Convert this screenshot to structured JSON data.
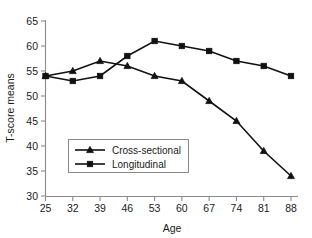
{
  "chart_data": {
    "type": "line",
    "title": "",
    "xlabel": "Age",
    "ylabel": "T-score means",
    "x": [
      25,
      32,
      39,
      46,
      53,
      60,
      67,
      74,
      81,
      88
    ],
    "xticklabels": [
      "25",
      "32",
      "39",
      "46",
      "53",
      "60",
      "67",
      "74",
      "81",
      "88"
    ],
    "yticklabels": [
      "30",
      "35",
      "40",
      "45",
      "50",
      "55",
      "60",
      "65"
    ],
    "yticks": [
      30,
      35,
      40,
      45,
      50,
      55,
      60,
      65
    ],
    "xlim": [
      25,
      88
    ],
    "ylim": [
      30,
      65
    ],
    "grid": false,
    "legend_position": "lower-left-inside",
    "series": [
      {
        "name": "Cross-sectional",
        "marker": "triangle",
        "color": "#111111",
        "values": [
          54,
          55,
          57,
          56,
          54,
          53,
          49,
          45,
          39,
          34
        ]
      },
      {
        "name": "Longitudinal",
        "marker": "square",
        "color": "#111111",
        "values": [
          54,
          53,
          54,
          58,
          61,
          60,
          59,
          57,
          56,
          54
        ]
      }
    ]
  },
  "legend": {
    "items": [
      {
        "label": "Cross-sectional",
        "marker": "triangle"
      },
      {
        "label": "Longitudinal",
        "marker": "square"
      }
    ]
  },
  "axes": {
    "x_title": "Age",
    "y_title": "T-score means"
  }
}
